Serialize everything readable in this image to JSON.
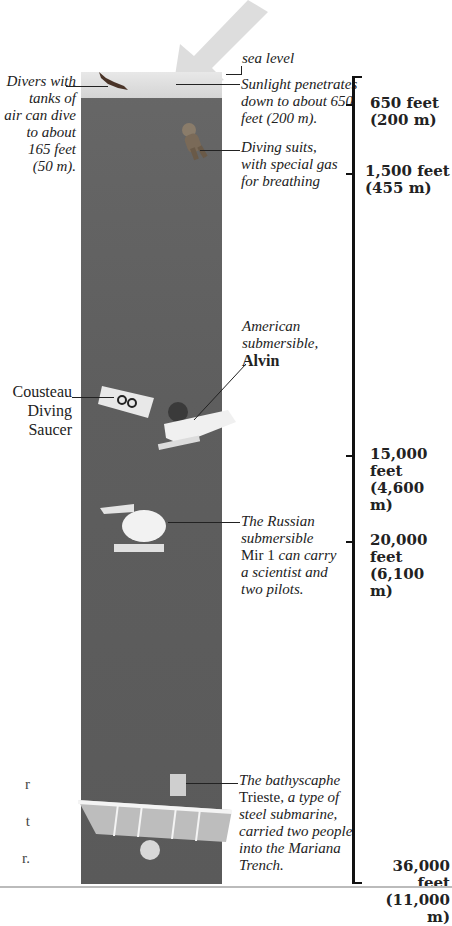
{
  "captions": {
    "sea_level": "sea level",
    "divers": [
      "Divers with",
      "tanks of",
      "air can dive",
      "to about",
      "165 feet",
      "(50 m)."
    ],
    "sunlight": [
      "Sunlight penetrates",
      "down to about 650",
      "feet (200 m)."
    ],
    "diving_suits": [
      "Diving suits,",
      "with special gas",
      "for breathing"
    ],
    "alvin": {
      "line1": "American",
      "line2": "submersible,",
      "name": "Alvin"
    },
    "cousteau": [
      "Cousteau",
      "Diving",
      "Saucer"
    ],
    "mir": {
      "line1": "The Russian",
      "line2": "submersible",
      "name": "Mir 1",
      "line3_rest": " can carry",
      "line4": "a scientist and",
      "line5": "two pilots."
    },
    "trieste": {
      "line1": "The bathyscaphe",
      "name": "Trieste",
      "line2_rest": ", a type of",
      "line3": "steel submarine,",
      "line4": "carried two people",
      "line5": "into the Mariana",
      "line6": "Trench."
    },
    "left_fragments": [
      "r",
      "t",
      "r."
    ]
  },
  "depth_scale": [
    {
      "feet": "650 feet",
      "meters": "(200 m)"
    },
    {
      "feet": "1,500 feet",
      "meters": "(455 m)"
    },
    {
      "feet": "15,000 feet",
      "meters": "(4,600 m)"
    },
    {
      "feet": "20,000 feet",
      "meters": "(6,100 m)"
    },
    {
      "feet": "36,000 feet",
      "meters": "(11,000 m)"
    }
  ]
}
